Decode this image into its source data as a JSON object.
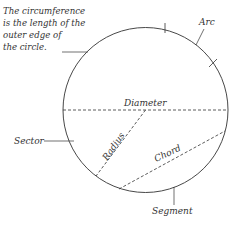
{
  "diagram": {
    "note_lines": [
      "The circumference",
      "is the length of the",
      "outer edge of",
      "the circle."
    ],
    "labels": {
      "arc": "Arc",
      "diameter": "Diameter",
      "radius": "Radius",
      "chord": "Chord",
      "sector": "Sector",
      "segment": "Segment"
    },
    "colors": {
      "line": "#333333",
      "background": "#ffffff"
    },
    "geometry": {
      "center": [
        145.5,
        110
      ],
      "radius": 82.5
    }
  }
}
